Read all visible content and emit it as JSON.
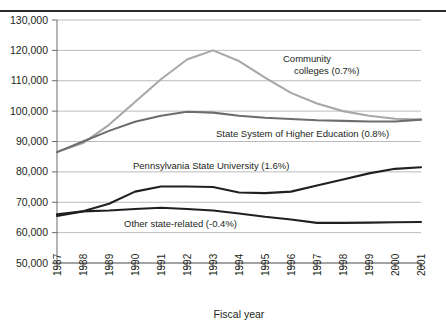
{
  "chart_data": {
    "type": "line",
    "title": "",
    "xlabel": "Fiscal year",
    "ylabel": "",
    "x": [
      1987,
      1988,
      1989,
      1990,
      1991,
      1992,
      1993,
      1994,
      1995,
      1996,
      1997,
      1998,
      1999,
      2000,
      2001
    ],
    "categories": [
      "1987",
      "1988",
      "1989",
      "1990",
      "1991",
      "1992",
      "1993",
      "1994",
      "1995",
      "1996",
      "1997",
      "1998",
      "1999",
      "2000",
      "2001"
    ],
    "ylim": [
      50000,
      130000
    ],
    "yticks": [
      50000,
      60000,
      70000,
      80000,
      90000,
      100000,
      110000,
      120000,
      130000
    ],
    "ytick_labels": [
      "50,000",
      "60,000",
      "70,000",
      "80,000",
      "90,000",
      "100,000",
      "110,000",
      "120,000",
      "130,000"
    ],
    "grid": true,
    "legend": "inline-annotations",
    "series": [
      {
        "name": "Community colleges",
        "annotation_line1": "Community",
        "annotation_line2": "colleges (0.7%)",
        "rate": "0.7%",
        "color": "#a8a8a8",
        "width": 2.1,
        "values": [
          86500,
          89500,
          95500,
          103000,
          110500,
          117000,
          120000,
          116500,
          111000,
          106000,
          102500,
          100000,
          98500,
          97500,
          97200
        ]
      },
      {
        "name": "State System of Higher Education",
        "annotation_line1": "State System of Higher Education (0.8%)",
        "rate": "0.8%",
        "color": "#6d6d6d",
        "width": 2.1,
        "values": [
          86500,
          90000,
          93500,
          96500,
          98500,
          99800,
          99500,
          98500,
          97800,
          97400,
          97000,
          96800,
          96600,
          96600,
          97200
        ]
      },
      {
        "name": "Pennsylvania State University",
        "annotation_line1": "Pennsylvania State University (1.6%)",
        "rate": "1.6%",
        "color": "#231f20",
        "width": 2.1,
        "values": [
          65500,
          67000,
          69500,
          73500,
          75200,
          75200,
          75000,
          73200,
          73000,
          73500,
          75500,
          77500,
          79500,
          81000,
          81500
        ]
      },
      {
        "name": "Other state-related",
        "annotation_line1": "Other state-related (-0.4%)",
        "rate": "-0.4%",
        "color": "#231f20",
        "width": 2.1,
        "values": [
          66000,
          67000,
          67300,
          67800,
          68200,
          67800,
          67300,
          66300,
          65200,
          64300,
          63200,
          63200,
          63300,
          63400,
          63500
        ]
      }
    ],
    "annotations": [
      {
        "text": "Community",
        "x": 283,
        "y": 62
      },
      {
        "text": "colleges (0.7%)",
        "x": 294,
        "y": 74
      },
      {
        "text": "State System of Higher Education (0.8%)",
        "x": 216,
        "y": 137
      },
      {
        "text": "Pennsylvania State University (1.6%)",
        "x": 133,
        "y": 169
      },
      {
        "text": "Other state-related (-0.4%)",
        "x": 124,
        "y": 227
      }
    ]
  },
  "axis": {
    "x_title": "Fiscal year"
  }
}
